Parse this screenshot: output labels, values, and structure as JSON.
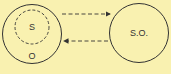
{
  "diagram": {
    "background": "#f9f1b0",
    "stroke_color": "#333333",
    "left_node": {
      "outer_label": "O",
      "inner_label": "S"
    },
    "right_node": {
      "label": "S.O."
    },
    "arrows": [
      {
        "from": "left_node",
        "to": "right_node",
        "style": "dashed"
      },
      {
        "from": "right_node",
        "to": "left_node",
        "style": "dashed"
      }
    ]
  }
}
